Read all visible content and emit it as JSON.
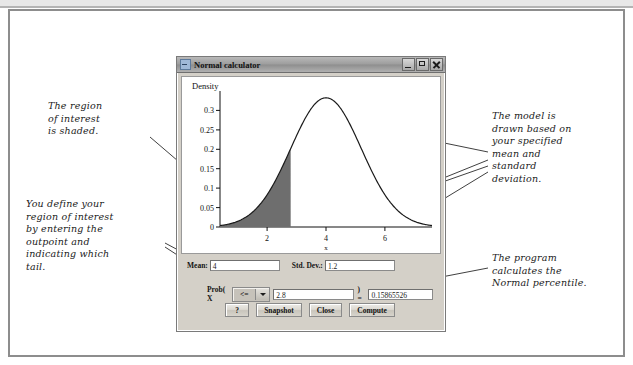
{
  "window": {
    "title": "Normal calculator",
    "icon": "application-icon",
    "controls": {
      "minimize": "minimize-icon",
      "maximize": "maximize-icon",
      "close": "close-icon"
    }
  },
  "fields": {
    "mean_label": "Mean:",
    "mean_value": "4",
    "sd_label": "Std. Dev.:",
    "sd_value": "1.2",
    "prob_prefix": "Prob( X",
    "tail_operator": "<=",
    "tail_options": [
      "<=",
      ">="
    ],
    "cutpoint_value": "2.8",
    "equals": ") =",
    "result_value": "0.15865526"
  },
  "buttons": {
    "help": "?",
    "snapshot": "Snapshot",
    "close": "Close",
    "compute": "Compute"
  },
  "annotations": {
    "region": "The region\nof interest\nis shaded.",
    "define": "You define your\nregion of interest\nby entering the\noutpoint and\nindicating which\ntail.",
    "model": "The model is\ndrawn based on\nyour specified\nmean and\nstandard\ndeviation.",
    "program": "The program\ncalculates the\nNormal percentile."
  },
  "chart_data": {
    "type": "line",
    "title": "",
    "ylabel": "Density",
    "xlabel": "x",
    "y_ticks": [
      "0",
      "0.05",
      "0.1",
      "0.15",
      "0.2",
      "0.25",
      "0.3"
    ],
    "y_tick_values": [
      0,
      0.05,
      0.1,
      0.15,
      0.2,
      0.25,
      0.3
    ],
    "x_ticks": [
      "2",
      "4",
      "6"
    ],
    "x_tick_values": [
      2,
      4,
      6
    ],
    "xlim": [
      0.4,
      7.6
    ],
    "ylim": [
      0,
      0.35
    ],
    "grid": false,
    "legend": "none",
    "distribution": "normal",
    "mean": 4,
    "sd": 1.2,
    "peak_density": 0.3324,
    "shaded_region": {
      "from": 0.4,
      "to": 2.8,
      "area": 0.15865526,
      "color": "#6e6e6e",
      "label": "region of interest"
    },
    "curve_color": "#1a1a1a"
  }
}
